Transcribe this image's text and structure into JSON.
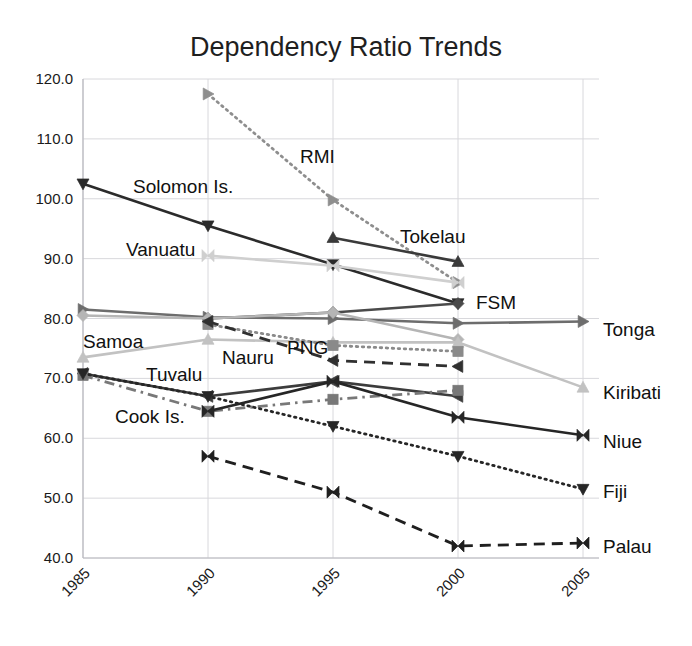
{
  "chart_data": {
    "type": "line",
    "title": "Dependency Ratio Trends",
    "xlabel": "",
    "ylabel": "",
    "x": [
      1985,
      1990,
      1995,
      2000,
      2005
    ],
    "xtick_labels": [
      "1985",
      "1990",
      "1995",
      "2000",
      "2005"
    ],
    "ytick_labels": [
      "40.0",
      "50.0",
      "60.0",
      "70.0",
      "80.0",
      "90.0",
      "100.0",
      "110.0",
      "120.0"
    ],
    "ylim": [
      40,
      120
    ],
    "ytick_step": 10,
    "grid": true,
    "legend_position": "inline-annotations-and-right-labels",
    "series": [
      {
        "name": "RMI",
        "label_pos": "inline",
        "color": "#8e8e8e",
        "line": "dotted",
        "marker": "triangle-right",
        "x": [
          1990,
          1995,
          2000
        ],
        "values": [
          117.5,
          99.8,
          86.0
        ]
      },
      {
        "name": "Solomon Is.",
        "label_pos": "inline",
        "color": "#2b2b2b",
        "line": "solid",
        "marker": "triangle-down",
        "x": [
          1985,
          1990,
          1995,
          2000
        ],
        "values": [
          102.5,
          95.5,
          89.0,
          82.5
        ]
      },
      {
        "name": "Vanuatu",
        "label_pos": "inline",
        "color": "#cfcfcf",
        "line": "solid",
        "marker": "bowtie",
        "x": [
          1990,
          1995,
          2000
        ],
        "values": [
          90.5,
          88.8,
          86.0
        ]
      },
      {
        "name": "Tokelau",
        "label_pos": "inline",
        "color": "#3a3a3a",
        "line": "solid",
        "marker": "triangle-up",
        "x": [
          1995,
          2000
        ],
        "values": [
          93.5,
          89.5
        ]
      },
      {
        "name": "FSM",
        "label_pos": "inline",
        "color": "#4a4a4a",
        "line": "solid",
        "marker": "diamond",
        "x": [
          1990,
          1995,
          2000
        ],
        "values": [
          80.0,
          81.0,
          82.5
        ]
      },
      {
        "name": "Tonga",
        "label_pos": "right",
        "color": "#6d6d6d",
        "line": "solid",
        "marker": "triangle-right",
        "x": [
          1985,
          1990,
          1995,
          2000,
          2005
        ],
        "values": [
          81.5,
          80.2,
          80.0,
          79.2,
          79.5
        ]
      },
      {
        "name": "Samoa",
        "label_pos": "inline",
        "color": "#b5b5b5",
        "line": "solid",
        "marker": "diamond",
        "x": [
          1985,
          1990,
          1995,
          2000
        ],
        "values": [
          80.5,
          80.0,
          81.0,
          76.5
        ]
      },
      {
        "name": "Kiribati",
        "label_pos": "right",
        "color": "#c2c2c2",
        "line": "solid",
        "marker": "triangle-up",
        "x": [
          1985,
          1990,
          1995,
          2000,
          2005
        ],
        "values": [
          73.5,
          76.5,
          76.0,
          76.0,
          68.5
        ]
      },
      {
        "name": "PNG",
        "label_pos": "inline",
        "color": "#8a8a8a",
        "line": "dotted",
        "marker": "square",
        "x": [
          1990,
          1995,
          2000
        ],
        "values": [
          79.0,
          75.5,
          74.5
        ]
      },
      {
        "name": "Nauru",
        "label_pos": "inline",
        "color": "#303030",
        "line": "dashed",
        "marker": "triangle-left",
        "x": [
          1990,
          1995,
          2000
        ],
        "values": [
          79.5,
          73.0,
          72.0
        ]
      },
      {
        "name": "Tuvalu",
        "label_pos": "inline",
        "color": "#3c3c3c",
        "line": "solid",
        "marker": "triangle-left",
        "x": [
          1985,
          1990,
          1995,
          2000
        ],
        "values": [
          70.8,
          67.0,
          69.5,
          67.0
        ]
      },
      {
        "name": "Cook Is.",
        "label_pos": "inline",
        "color": "#787878",
        "line": "dash-dot",
        "marker": "square",
        "x": [
          1985,
          1990,
          1995,
          2000
        ],
        "values": [
          70.5,
          64.5,
          66.5,
          68.0
        ]
      },
      {
        "name": "Niue",
        "label_pos": "right",
        "color": "#262626",
        "line": "solid",
        "marker": "bowtie",
        "x": [
          1990,
          1995,
          2000,
          2005
        ],
        "values": [
          64.5,
          69.5,
          63.5,
          60.5
        ]
      },
      {
        "name": "Fiji",
        "label_pos": "right",
        "color": "#262626",
        "line": "dotted",
        "marker": "triangle-down",
        "x": [
          1985,
          1990,
          1995,
          2000,
          2005
        ],
        "values": [
          70.8,
          67.0,
          62.0,
          57.0,
          51.5
        ]
      },
      {
        "name": "Palau",
        "label_pos": "right",
        "color": "#1f1f1f",
        "line": "dashed",
        "marker": "bowtie",
        "x": [
          1990,
          1995,
          2000,
          2005
        ],
        "values": [
          57.0,
          51.0,
          42.0,
          42.5
        ]
      }
    ],
    "inline_annotations": [
      {
        "text": "RMI",
        "x": 300,
        "y": 163
      },
      {
        "text": "Solomon Is.",
        "x": 133,
        "y": 193
      },
      {
        "text": "Vanuatu",
        "x": 126,
        "y": 256
      },
      {
        "text": "Tokelau",
        "x": 400,
        "y": 243
      },
      {
        "text": "FSM",
        "x": 476,
        "y": 309
      },
      {
        "text": "Samoa",
        "x": 83,
        "y": 348
      },
      {
        "text": "Nauru",
        "x": 222,
        "y": 364
      },
      {
        "text": "PNG",
        "x": 287,
        "y": 354
      },
      {
        "text": "Tuvalu",
        "x": 146,
        "y": 381
      },
      {
        "text": "Cook Is.",
        "x": 115,
        "y": 423
      }
    ],
    "right_labels": [
      {
        "text": "Tonga",
        "y": 336
      },
      {
        "text": "Kiribati",
        "y": 399
      },
      {
        "text": "Niue",
        "y": 448
      },
      {
        "text": "Fiji",
        "y": 498
      },
      {
        "text": "Palau",
        "y": 553
      }
    ]
  }
}
